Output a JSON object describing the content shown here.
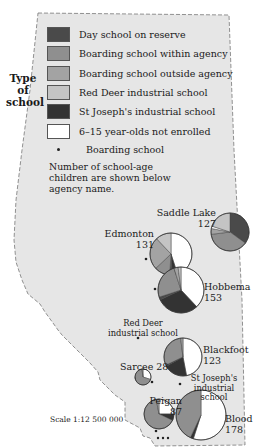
{
  "legend": {
    "title": "Type of school",
    "title_line1": "Type of",
    "title_line2": "school",
    "items": [
      {
        "label": "Day school on reserve",
        "color": "#4a4a4a"
      },
      {
        "label": "Boarding school within agency",
        "color": "#8f8f8f"
      },
      {
        "label": "Boarding school outside agency",
        "color": "#a3a3a3"
      },
      {
        "label": "Red Deer industrial school",
        "color": "#c4c4c4"
      },
      {
        "label": "St Joseph's industrial school",
        "color": "#333333"
      },
      {
        "label": "6–15 year-olds not enrolled",
        "color": "#ffffff"
      }
    ],
    "dot_label": "Boarding school",
    "note": "Number of school-age children are shown below agency name."
  },
  "agencies": [
    {
      "name": "Saddle Lake",
      "count": "127"
    },
    {
      "name": "Edmonton",
      "count": "131"
    },
    {
      "name": "Hobbema",
      "count": "153"
    },
    {
      "name": "Blackfoot",
      "count": "123"
    },
    {
      "name": "Sarcee",
      "count": "28"
    },
    {
      "name": "Peigan",
      "count": "87"
    },
    {
      "name": "Blood",
      "count": "178"
    }
  ],
  "schools": {
    "red_deer": "Red Deer industrial school",
    "st_joseph": "St Joseph's industrial school"
  },
  "scale": "Scale 1:12 500 000",
  "chart_data": {
    "type": "pie",
    "categories": [
      "Day school on reserve",
      "Boarding school within agency",
      "Boarding school outside agency",
      "Red Deer industrial school",
      "St Joseph's industrial school",
      "6–15 year-olds not enrolled"
    ],
    "series": [
      {
        "name": "Saddle Lake",
        "total": 127,
        "values": [
          35,
          38,
          5,
          20,
          0,
          2
        ]
      },
      {
        "name": "Edmonton",
        "total": 131,
        "values": [
          2,
          12,
          25,
          12,
          4,
          45
        ]
      },
      {
        "name": "Hobbema",
        "total": 153,
        "values": [
          2,
          25,
          3,
          2,
          30,
          38
        ]
      },
      {
        "name": "Blackfoot",
        "total": 123,
        "values": [
          1,
          30,
          2,
          0,
          20,
          47
        ]
      },
      {
        "name": "Sarcee",
        "total": 28,
        "values": [
          0,
          68,
          2,
          0,
          0,
          30
        ]
      },
      {
        "name": "Peigan",
        "total": 87,
        "values": [
          0,
          65,
          3,
          0,
          7,
          25
        ]
      },
      {
        "name": "Blood",
        "total": 178,
        "values": [
          0,
          43,
          0,
          0,
          2,
          55
        ]
      }
    ],
    "units": "percent of school-age children (estimated)"
  }
}
